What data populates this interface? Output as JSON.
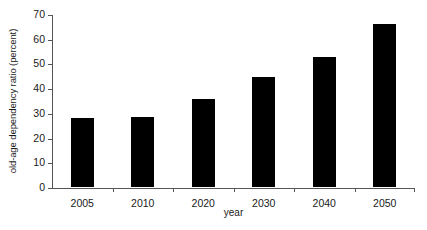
{
  "chart_data": {
    "type": "bar",
    "title": "",
    "subtitle": "",
    "xlabel": "year",
    "ylabel": "old-age dependency ratio (percent)",
    "categories": [
      "2005",
      "2010",
      "2020",
      "2030",
      "2040",
      "2050"
    ],
    "values": [
      28,
      28.5,
      35.5,
      44.5,
      52.5,
      66
    ],
    "ylim": [
      0,
      70
    ],
    "yticks": [
      0,
      10,
      20,
      30,
      40,
      50,
      60,
      70
    ],
    "ytick_labels": [
      "0",
      "10",
      "20",
      "30",
      "40",
      "50",
      "60",
      "70"
    ],
    "grid": false,
    "legend": false,
    "legend_position": "none",
    "bar_color": "#000000",
    "axis_color": "#555555",
    "background_color": "#ffffff"
  }
}
